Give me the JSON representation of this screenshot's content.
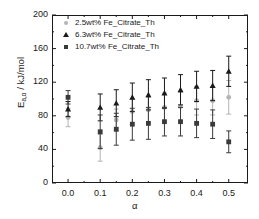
{
  "chart_data": {
    "type": "scatter",
    "title": "",
    "xlabel": "α",
    "ylabel": "E_{a,α} / kJ/mol",
    "ylabel_main": "E",
    "ylabel_sub": "a,α",
    "ylabel_unit": " / kJ/mol",
    "xlim": [
      -0.05,
      0.56
    ],
    "ylim": [
      0,
      200
    ],
    "xticks": [
      "0.0",
      "0.1",
      "0.2",
      "0.3",
      "0.4",
      "0.5"
    ],
    "xtick_values": [
      0.0,
      0.1,
      0.2,
      0.3,
      0.4,
      0.5
    ],
    "yticks": [
      "0",
      "40",
      "80",
      "120",
      "160",
      "200"
    ],
    "ytick_values": [
      0,
      40,
      80,
      120,
      160,
      200
    ],
    "grid": false,
    "legend_position": "top-left",
    "error_bars": true,
    "series": [
      {
        "name": "2.5wt% Fe_Citrate_Th",
        "marker": "circle",
        "color": "#b4b4b4",
        "x": [
          0.0,
          0.1,
          0.15,
          0.2,
          0.25,
          0.3,
          0.35,
          0.4,
          0.45,
          0.5
        ],
        "values": [
          78,
          42,
          75,
          85,
          87,
          90,
          91,
          98,
          98,
          102
        ],
        "errors": [
          11,
          16,
          13,
          15,
          15,
          17,
          17,
          17,
          17,
          20
        ]
      },
      {
        "name": "6.3wt% Fe_Citrate_Th",
        "marker": "triangle",
        "color": "#1a1a1a",
        "x": [
          0.0,
          0.1,
          0.15,
          0.2,
          0.25,
          0.3,
          0.35,
          0.4,
          0.45,
          0.5
        ],
        "values": [
          88,
          90,
          95,
          102,
          105,
          107,
          111,
          115,
          116,
          133
        ],
        "errors": [
          9,
          16,
          16,
          17,
          18,
          18,
          18,
          18,
          18,
          18
        ]
      },
      {
        "name": "10.7wt% Fe_Citrate_Th",
        "marker": "square",
        "color": "#3a3a3a",
        "x": [
          0.0,
          0.1,
          0.15,
          0.2,
          0.25,
          0.3,
          0.35,
          0.4,
          0.45,
          0.5
        ],
        "values": [
          102,
          61,
          64,
          70,
          71,
          73,
          73,
          71,
          70,
          49
        ],
        "errors": [
          8,
          20,
          19,
          19,
          19,
          17,
          17,
          17,
          17,
          13
        ]
      }
    ]
  },
  "legend": {
    "entries": [
      {
        "label": "2.5wt% Fe_Citrate_Th",
        "marker": "circle"
      },
      {
        "label": "6.3wt% Fe_Citrate_Th",
        "marker": "triangle"
      },
      {
        "label": "10.7wt% Fe_Citrate_Th",
        "marker": "square"
      }
    ]
  }
}
